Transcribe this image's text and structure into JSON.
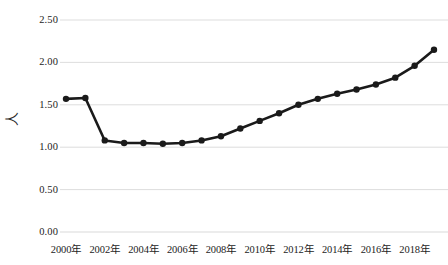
{
  "chart_data": {
    "type": "line",
    "title": "",
    "xlabel": "",
    "ylabel": "人",
    "ylim": [
      0.0,
      2.5
    ],
    "yticks": [
      0.0,
      0.5,
      1.0,
      1.5,
      2.0,
      2.5
    ],
    "ytick_labels": [
      "0.00",
      "0.50",
      "1.00",
      "1.50",
      "2.00",
      "2.50"
    ],
    "grid": true,
    "legend": false,
    "marker": "circle",
    "line_color": "#1a1a1a",
    "grid_color": "#d9d9d9",
    "categories": [
      "2000年",
      "2001年",
      "2002年",
      "2003年",
      "2004年",
      "2005年",
      "2006年",
      "2007年",
      "2008年",
      "2009年",
      "2010年",
      "2011年",
      "2012年",
      "2013年",
      "2014年",
      "2015年",
      "2016年",
      "2017年",
      "2018年",
      "2019年"
    ],
    "x": [
      2000,
      2001,
      2002,
      2003,
      2004,
      2005,
      2006,
      2007,
      2008,
      2009,
      2010,
      2011,
      2012,
      2013,
      2014,
      2015,
      2016,
      2017,
      2018,
      2019
    ],
    "values": [
      1.57,
      1.58,
      1.08,
      1.05,
      1.05,
      1.04,
      1.05,
      1.08,
      1.13,
      1.22,
      1.31,
      1.4,
      1.5,
      1.57,
      1.63,
      1.68,
      1.74,
      1.82,
      1.96,
      2.15
    ],
    "xtick_labels": [
      "2000年",
      "2002年",
      "2004年",
      "2006年",
      "2008年",
      "2010年",
      "2012年",
      "2014年",
      "2016年",
      "2018年"
    ],
    "xtick_values": [
      2000,
      2002,
      2004,
      2006,
      2008,
      2010,
      2012,
      2014,
      2016,
      2018
    ]
  }
}
